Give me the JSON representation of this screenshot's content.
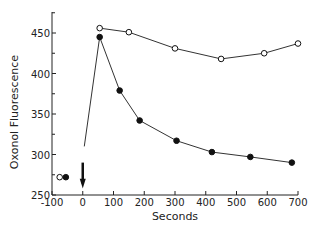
{
  "chart_data": {
    "type": "line",
    "title": "",
    "xlabel": "Seconds",
    "ylabel": "Oxonol Fluorescence",
    "xlim": [
      -100,
      700
    ],
    "ylim": [
      250,
      475
    ],
    "x_ticks": [
      "-100",
      "0",
      "100",
      "200",
      "300",
      "400",
      "500",
      "600",
      "700"
    ],
    "y_ticks": [
      "250",
      "300",
      "350",
      "400",
      "450"
    ],
    "grid": false,
    "legend": "none",
    "series": [
      {
        "name": "open circles",
        "marker": "open-circle",
        "x": [
          -75,
          55,
          150,
          300,
          450,
          590,
          700
        ],
        "y": [
          272,
          456,
          451,
          431,
          418,
          425,
          437
        ]
      },
      {
        "name": "filled circles",
        "marker": "filled-circle",
        "x": [
          -55,
          55,
          120,
          185,
          305,
          420,
          545,
          680
        ],
        "y": [
          272,
          445,
          379,
          342,
          317,
          303,
          297,
          290
        ]
      }
    ],
    "annotations": [
      {
        "type": "arrow-down",
        "x": 0,
        "y": 270,
        "note": "addition marker at t=0"
      },
      {
        "type": "line",
        "note": "rise from ~310 at t=5 to peak ~445 at t=55"
      }
    ]
  }
}
